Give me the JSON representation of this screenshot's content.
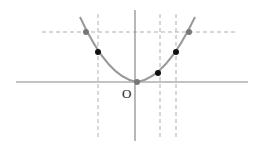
{
  "diagram": {
    "type": "parabola-plot",
    "origin_label": "O",
    "colors": {
      "axis": "#888888",
      "curve": "#999999",
      "dashed": "#b0b0b0",
      "point_black": "#111111",
      "point_gray": "#777777"
    },
    "points": [
      {
        "name": "point-gray-left",
        "color": "gray"
      },
      {
        "name": "point-black-left",
        "color": "black"
      },
      {
        "name": "point-origin",
        "color": "gray"
      },
      {
        "name": "point-black-right-low",
        "color": "black"
      },
      {
        "name": "point-black-right-high",
        "color": "black"
      },
      {
        "name": "point-gray-right",
        "color": "gray"
      }
    ]
  }
}
